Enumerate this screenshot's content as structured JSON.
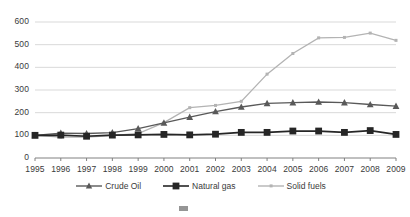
{
  "chart_data": {
    "type": "line",
    "title": "",
    "xlabel": "",
    "ylabel": "",
    "x": [
      1995,
      1996,
      1997,
      1998,
      1999,
      2000,
      2001,
      2002,
      2003,
      2004,
      2005,
      2006,
      2007,
      2008,
      2009
    ],
    "categories": [
      "1995",
      "1996",
      "1997",
      "1998",
      "1999",
      "2000",
      "2001",
      "2002",
      "2003",
      "2004",
      "2005",
      "2006",
      "2007",
      "2008",
      "2009"
    ],
    "ylim": [
      0,
      600
    ],
    "yticks": [
      0,
      100,
      200,
      300,
      400,
      500,
      600
    ],
    "ytick_labels": [
      "0",
      "100",
      "200",
      "300",
      "400",
      "500",
      "600"
    ],
    "grid": "horizontal",
    "legend_position": "bottom",
    "series": [
      {
        "name": "Crude Oil",
        "color": "#595959",
        "marker": "triangle",
        "values": [
          100,
          110,
          108,
          112,
          130,
          155,
          180,
          205,
          225,
          241,
          244,
          247,
          244,
          236,
          229
        ]
      },
      {
        "name": "Natural gas",
        "color": "#262626",
        "marker": "square",
        "values": [
          100,
          101,
          96,
          101,
          102,
          104,
          102,
          105,
          113,
          113,
          119,
          119,
          113,
          121,
          104
        ]
      },
      {
        "name": "Solid fuels",
        "color": "#b3b3b3",
        "marker": "small-square",
        "values": [
          100,
          92,
          92,
          99,
          108,
          156,
          222,
          232,
          250,
          370,
          461,
          530,
          532,
          551,
          519
        ]
      }
    ]
  },
  "axis": {
    "tick_color": "#808080",
    "gridline_color": "#d9d9d9",
    "label_color": "#3a3a3a"
  },
  "legend": {
    "items": [
      {
        "label": "Crude Oil",
        "color": "#595959",
        "marker": "triangle"
      },
      {
        "label": "Natural gas",
        "color": "#262626",
        "marker": "square"
      },
      {
        "label": "Solid fuels",
        "color": "#b3b3b3",
        "marker": "line"
      }
    ]
  },
  "clipped_legend": {
    "items": [
      {
        "label": ""
      },
      {
        "label": ""
      },
      {
        "label": ""
      }
    ]
  }
}
